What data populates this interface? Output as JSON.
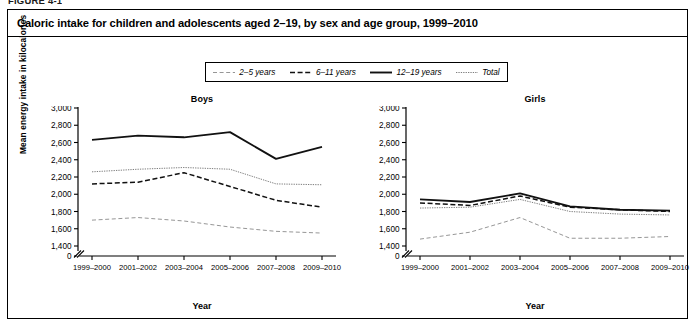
{
  "figure": {
    "caption_label": "FIGURE 4-1",
    "title": "Caloric intake for children and adolescents aged 2–19, by sex and age group, 1999–2010"
  },
  "legend": {
    "items": [
      {
        "label": "2–5 years",
        "style": "fine-dashed",
        "icon": "legend-line-fine-dashed-icon"
      },
      {
        "label": "6–11 years",
        "style": "dashed",
        "icon": "legend-line-dashed-icon"
      },
      {
        "label": "12–19 years",
        "style": "solid-thick",
        "icon": "legend-line-solid-icon"
      },
      {
        "label": "Total",
        "style": "dotted",
        "icon": "legend-line-dotted-icon"
      }
    ]
  },
  "axes": {
    "ylabel": "Mean energy intake in kilocalories",
    "xlabel": "Year",
    "ytick_labels": [
      "3,000",
      "2,800",
      "2,600",
      "2,400",
      "2,200",
      "2,000",
      "1,800",
      "1,600",
      "1,400",
      "0"
    ],
    "ytick_values": [
      3000,
      2800,
      2600,
      2400,
      2200,
      2000,
      1800,
      1600,
      1400,
      0
    ],
    "axis_break": true,
    "xtick_labels": [
      "1999–2000",
      "2001–2002",
      "2003–2004",
      "2005–2006",
      "2007–2008",
      "2009–2010"
    ]
  },
  "panels": [
    {
      "key": "boys",
      "title": "Boys"
    },
    {
      "key": "girls",
      "title": "Girls"
    }
  ],
  "chart_data": [
    {
      "type": "line",
      "title": "Boys",
      "xlabel": "Year",
      "ylabel": "Mean energy intake in kilocalories",
      "categories": [
        "1999–2000",
        "2001–2002",
        "2003–2004",
        "2005–2006",
        "2007–2008",
        "2009–2010"
      ],
      "ylim": [
        1400,
        3000
      ],
      "ytick_values": [
        1400,
        1600,
        1800,
        2000,
        2200,
        2400,
        2600,
        2800,
        3000
      ],
      "axis_break_below": 1400,
      "grid": false,
      "legend_position": "top-center-shared",
      "series": [
        {
          "name": "2–5 years",
          "style": "fine-dashed",
          "values": [
            1700,
            1730,
            1690,
            1620,
            1570,
            1550
          ]
        },
        {
          "name": "6–11 years",
          "style": "dashed",
          "values": [
            2120,
            2140,
            2250,
            2090,
            1930,
            1850
          ]
        },
        {
          "name": "12–19 years",
          "style": "solid-thick",
          "values": [
            2630,
            2680,
            2660,
            2720,
            2410,
            2550
          ]
        },
        {
          "name": "Total",
          "style": "dotted",
          "values": [
            2260,
            2290,
            2310,
            2290,
            2120,
            2110
          ]
        }
      ]
    },
    {
      "type": "line",
      "title": "Girls",
      "xlabel": "Year",
      "ylabel": "Mean energy intake in kilocalories",
      "categories": [
        "1999–2000",
        "2001–2002",
        "2003–2004",
        "2005–2006",
        "2007–2008",
        "2009–2010"
      ],
      "ylim": [
        1400,
        3000
      ],
      "ytick_values": [
        1400,
        1600,
        1800,
        2000,
        2200,
        2400,
        2600,
        2800,
        3000
      ],
      "axis_break_below": 1400,
      "grid": false,
      "legend_position": "top-center-shared",
      "series": [
        {
          "name": "2–5 years",
          "style": "fine-dashed",
          "values": [
            1480,
            1560,
            1730,
            1490,
            1490,
            1510
          ]
        },
        {
          "name": "6–11 years",
          "style": "dashed",
          "values": [
            1900,
            1870,
            1980,
            1850,
            1820,
            1800
          ]
        },
        {
          "name": "12–19 years",
          "style": "solid-thick",
          "values": [
            1940,
            1910,
            2010,
            1860,
            1820,
            1810
          ]
        },
        {
          "name": "Total",
          "style": "dotted",
          "values": [
            1840,
            1850,
            1940,
            1800,
            1770,
            1760
          ]
        }
      ]
    }
  ]
}
